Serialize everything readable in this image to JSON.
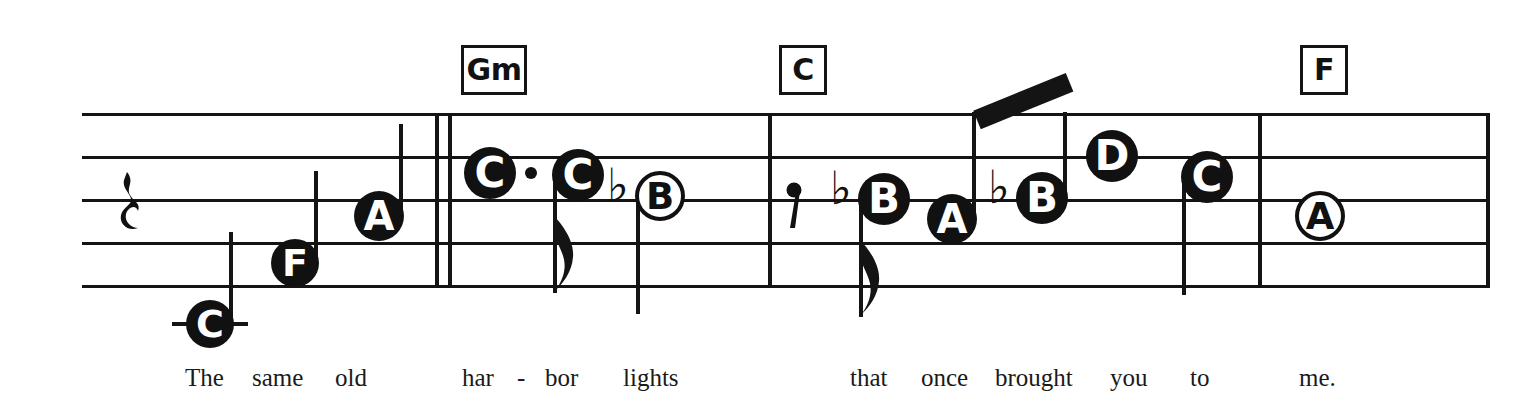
{
  "document": {
    "kind": "music-lead-sheet",
    "system_label": "single staff system with chord symbols and lyrics"
  },
  "staff": {
    "line_count": 5,
    "left": 82,
    "right": 1488,
    "line_y": [
      113,
      156,
      199,
      242,
      285
    ],
    "color": "#141414"
  },
  "barlines": [
    {
      "name": "double-barline-after-pickup",
      "x": 435,
      "kind": "double"
    },
    {
      "name": "barline-measure-2-end",
      "x": 768,
      "kind": "single"
    },
    {
      "name": "barline-measure-3-end",
      "x": 1258,
      "kind": "single"
    },
    {
      "name": "barline-system-end",
      "x": 1486,
      "kind": "single"
    }
  ],
  "chords": [
    {
      "label": "Gm",
      "x": 461,
      "y": 45,
      "w": 60,
      "h": 44
    },
    {
      "label": "C",
      "x": 779,
      "y": 45,
      "w": 42,
      "h": 44
    },
    {
      "label": "F",
      "x": 1300,
      "y": 45,
      "w": 42,
      "h": 44
    }
  ],
  "rests": [
    {
      "name": "quarter-rest",
      "x": 118,
      "y": 170,
      "type": "quarter"
    },
    {
      "name": "eighth-rest",
      "x": 786,
      "y": 180,
      "type": "eighth"
    }
  ],
  "notes": [
    {
      "name": "note-C-low",
      "pitch": "C",
      "head": "filled",
      "cx": 210,
      "cy": 324,
      "r": 24,
      "stem": "up",
      "ledger": true,
      "dotted": false,
      "flag": false,
      "accidental": ""
    },
    {
      "name": "note-F",
      "pitch": "F",
      "head": "filled",
      "cx": 295,
      "cy": 263,
      "r": 24,
      "stem": "up",
      "ledger": false,
      "dotted": false,
      "flag": false,
      "accidental": ""
    },
    {
      "name": "note-A-1",
      "pitch": "A",
      "head": "filled",
      "cx": 379,
      "cy": 216,
      "r": 25,
      "stem": "up",
      "ledger": false,
      "dotted": false,
      "flag": false,
      "accidental": ""
    },
    {
      "name": "note-C-dotted",
      "pitch": "C",
      "head": "filled",
      "cx": 490,
      "cy": 173,
      "r": 26,
      "stem": "none",
      "ledger": false,
      "dotted": true,
      "flag": false,
      "accidental": ""
    },
    {
      "name": "note-C-eighth",
      "pitch": "C",
      "head": "filled",
      "cx": 578,
      "cy": 175,
      "r": 26,
      "stem": "down",
      "ledger": false,
      "dotted": false,
      "flag": true,
      "accidental": ""
    },
    {
      "name": "note-B-flat-half",
      "pitch": "B",
      "head": "hollow",
      "cx": 660,
      "cy": 196,
      "r": 25,
      "stem": "down",
      "ledger": false,
      "dotted": false,
      "flag": false,
      "accidental": "flat"
    },
    {
      "name": "note-B-flat-eighth",
      "pitch": "B",
      "head": "filled",
      "cx": 884,
      "cy": 199,
      "r": 26,
      "stem": "down",
      "ledger": false,
      "dotted": false,
      "flag": true,
      "accidental": "flat"
    },
    {
      "name": "note-A-2",
      "pitch": "A",
      "head": "filled",
      "cx": 952,
      "cy": 219,
      "r": 25,
      "stem": "up",
      "ledger": false,
      "dotted": false,
      "flag": false,
      "accidental": "",
      "beamed": true
    },
    {
      "name": "note-B-flat-beamed",
      "pitch": "B",
      "head": "filled",
      "cx": 1042,
      "cy": 198,
      "r": 26,
      "stem": "up",
      "ledger": false,
      "dotted": false,
      "flag": false,
      "accidental": "flat",
      "beamed": true
    },
    {
      "name": "note-D",
      "pitch": "D",
      "head": "filled",
      "cx": 1112,
      "cy": 156,
      "r": 26,
      "stem": "none",
      "ledger": false,
      "dotted": false,
      "flag": false,
      "accidental": ""
    },
    {
      "name": "note-C-2",
      "pitch": "C",
      "head": "filled",
      "cx": 1207,
      "cy": 177,
      "r": 26,
      "stem": "down",
      "ledger": false,
      "dotted": false,
      "flag": false,
      "accidental": ""
    },
    {
      "name": "note-A-hollow",
      "pitch": "A",
      "head": "hollow",
      "cx": 1320,
      "cy": 216,
      "r": 25,
      "stem": "none",
      "ledger": false,
      "dotted": false,
      "flag": false,
      "accidental": ""
    }
  ],
  "beams": [
    {
      "name": "beam-A-to-Bflat",
      "x1": 977,
      "y1": 110,
      "x2": 1070,
      "y2": 72,
      "thickness": 20
    }
  ],
  "lyrics": [
    {
      "text": "The",
      "x": 185
    },
    {
      "text": "same",
      "x": 252
    },
    {
      "text": "old",
      "x": 335
    },
    {
      "text": "har",
      "x": 462
    },
    {
      "text": "-",
      "x": 517
    },
    {
      "text": "bor",
      "x": 545
    },
    {
      "text": "lights",
      "x": 623
    },
    {
      "text": "that",
      "x": 850
    },
    {
      "text": "once",
      "x": 921
    },
    {
      "text": "brought",
      "x": 995
    },
    {
      "text": "you",
      "x": 1110
    },
    {
      "text": "to",
      "x": 1190
    },
    {
      "text": "me.",
      "x": 1299
    }
  ],
  "lyrics_baseline_y": 365,
  "lyrics_font_size": 25
}
